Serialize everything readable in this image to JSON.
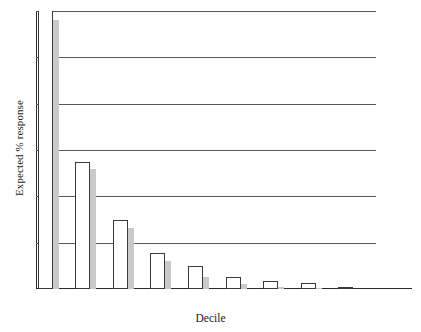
{
  "chart_data": {
    "type": "bar",
    "title": "",
    "xlabel": "Decile",
    "ylabel": "Expected % response",
    "categories": [
      "9",
      "8",
      "7",
      "6",
      "5",
      "4",
      "3",
      "2",
      "1",
      "0"
    ],
    "ylim": [
      0,
      6
    ],
    "yticks": [
      "0",
      "1",
      "2",
      "3",
      "4",
      "5",
      "6"
    ],
    "grid": true,
    "legend": "none",
    "series": [
      {
        "name": "white-bar",
        "style": "outlined",
        "color": "#ffffff",
        "edge_color": "#3a3a3a",
        "values": [
          6.25,
          2.75,
          1.5,
          0.78,
          0.5,
          0.25,
          0.17,
          0.12,
          0.05,
          0.0
        ]
      },
      {
        "name": "gray-bar",
        "style": "filled",
        "color": "#c9c9c9",
        "values": [
          5.8,
          2.6,
          1.32,
          0.6,
          0.25,
          0.1,
          0.05,
          0.03,
          0.0,
          0.0
        ]
      }
    ]
  }
}
